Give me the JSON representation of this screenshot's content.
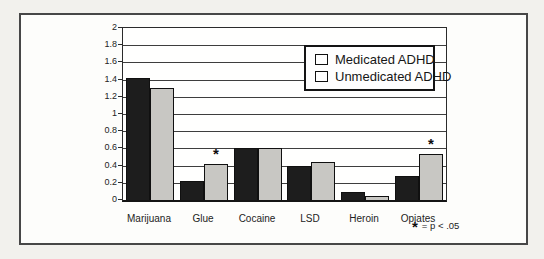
{
  "figure": {
    "footnote": {
      "asterisk": "*",
      "text": "= p < .05"
    }
  },
  "chart_data": {
    "type": "bar",
    "title": "",
    "xlabel": "",
    "ylabel": "",
    "categories": [
      "Marijuana",
      "Glue",
      "Cocaine",
      "LSD",
      "Heroin",
      "Opiates"
    ],
    "series": [
      {
        "name": "Medicated ADHD",
        "color": "#1d1d1d",
        "values": [
          1.42,
          0.22,
          0.6,
          0.4,
          0.09,
          0.28
        ]
      },
      {
        "name": "Unmedicated ADHD",
        "color": "#c8c7c3",
        "values": [
          1.3,
          0.42,
          0.6,
          0.44,
          0.05,
          0.54
        ]
      }
    ],
    "annotations": [
      {
        "category": "Glue",
        "series": "Unmedicated ADHD",
        "marker": "*",
        "meaning": "p < .05"
      },
      {
        "category": "Opiates",
        "series": "Unmedicated ADHD",
        "marker": "*",
        "meaning": "p < .05"
      }
    ],
    "y_axis": {
      "min": 0,
      "max": 2,
      "step": 0.2,
      "tick_labels": [
        "0",
        "0.2",
        "0.4",
        "0.6",
        "0.8",
        "1",
        "1.2",
        "1.4",
        "1.6",
        "1.8",
        "2"
      ]
    },
    "grid": true,
    "legend_position": "top-right-inside"
  }
}
